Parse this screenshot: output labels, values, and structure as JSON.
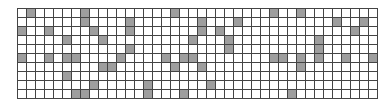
{
  "grid": {
    "rows": 10,
    "cols": 40,
    "cell_px": 9,
    "fill_color": "#9e9e9e",
    "empty_color": "#ffffff",
    "line_color": "#444444",
    "filled": [
      [
        0,
        1
      ],
      [
        0,
        7
      ],
      [
        0,
        17
      ],
      [
        0,
        28
      ],
      [
        0,
        31
      ],
      [
        1,
        7
      ],
      [
        1,
        12
      ],
      [
        1,
        20
      ],
      [
        1,
        24
      ],
      [
        1,
        35
      ],
      [
        1,
        38
      ],
      [
        2,
        0
      ],
      [
        2,
        3
      ],
      [
        2,
        8
      ],
      [
        2,
        12
      ],
      [
        2,
        20
      ],
      [
        2,
        22
      ],
      [
        2,
        37
      ],
      [
        3,
        5
      ],
      [
        3,
        9
      ],
      [
        3,
        19
      ],
      [
        3,
        23
      ],
      [
        3,
        33
      ],
      [
        4,
        12
      ],
      [
        4,
        23
      ],
      [
        4,
        33
      ],
      [
        5,
        0
      ],
      [
        5,
        3
      ],
      [
        5,
        5
      ],
      [
        5,
        6
      ],
      [
        5,
        11
      ],
      [
        5,
        16
      ],
      [
        5,
        18
      ],
      [
        5,
        19
      ],
      [
        5,
        28
      ],
      [
        5,
        29
      ],
      [
        5,
        31
      ],
      [
        5,
        33
      ],
      [
        5,
        36
      ],
      [
        5,
        39
      ],
      [
        6,
        9
      ],
      [
        6,
        10
      ],
      [
        6,
        17
      ],
      [
        6,
        20
      ],
      [
        6,
        31
      ],
      [
        7,
        5
      ],
      [
        8,
        8
      ],
      [
        8,
        14
      ],
      [
        8,
        21
      ],
      [
        9,
        6
      ],
      [
        9,
        7
      ],
      [
        9,
        14
      ],
      [
        9,
        18
      ],
      [
        9,
        30
      ]
    ]
  }
}
